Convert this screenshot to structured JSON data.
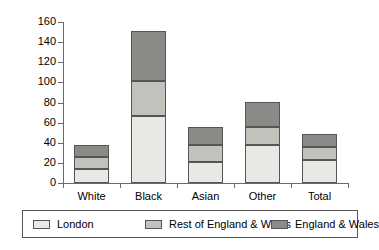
{
  "chart_data": {
    "type": "bar",
    "subtype": "stacked",
    "title": "",
    "xlabel": "",
    "ylabel": "",
    "categories": [
      "White",
      "Black",
      "Asian",
      "Other",
      "Total"
    ],
    "series": [
      {
        "name": "London",
        "color": "#e8e8e4",
        "values": [
          14,
          67,
          21,
          38,
          23
        ]
      },
      {
        "name": "Rest of England & Wales",
        "color": "#c2c2bd",
        "values": [
          12,
          34,
          17,
          18,
          13
        ]
      },
      {
        "name": "England & Wales",
        "color": "#8a8a86",
        "values": [
          12,
          50,
          18,
          25,
          13
        ]
      }
    ],
    "totals": [
      38,
      151,
      56,
      81,
      49
    ],
    "ylim": [
      0,
      160
    ],
    "ytick_step": 20,
    "yticks": [
      "0",
      "20",
      "40",
      "60",
      "80",
      "100",
      "120",
      "140",
      "160"
    ],
    "grid": false,
    "legend_position": "bottom"
  },
  "legend": {
    "entries": [
      {
        "label": "London"
      },
      {
        "label": "Rest of England & Wales"
      },
      {
        "label": "England & Wales"
      }
    ]
  },
  "colors": {
    "london": "#e8e8e4",
    "rest_of_england_wales": "#c2c2bd",
    "england_wales": "#8a8a86",
    "axis": "#6b6b6b",
    "outline": "#555555",
    "background": "#ffffff"
  }
}
